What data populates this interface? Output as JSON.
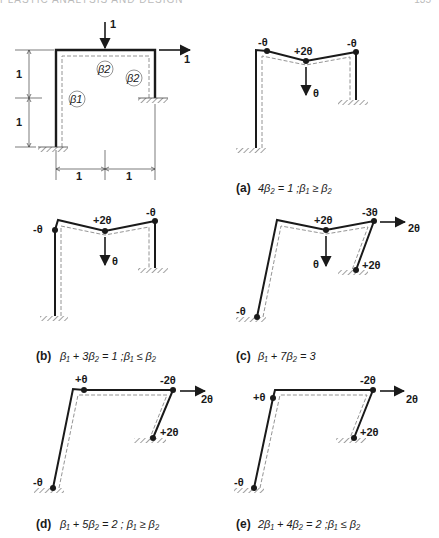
{
  "header": {
    "left_text": "PLASTIC ANALYSIS AND DESIGN",
    "right_text": "135"
  },
  "base_frame": {
    "load_vertical": "1",
    "load_horizontal": "1",
    "dim_v_upper": "1",
    "dim_v_lower": "1",
    "dim_h_left": "1",
    "dim_h_right": "1",
    "moment_labels": [
      "β1",
      "β2",
      "β2"
    ]
  },
  "panels": [
    {
      "id": "a",
      "caption_letter": "(a)",
      "caption_eq": "4β₂ = 1 ;β₁ ≥ β₂",
      "hinges": [
        "-θ",
        "+2θ",
        "-θ"
      ],
      "displacement": "θ"
    },
    {
      "id": "b",
      "caption_letter": "(b)",
      "caption_eq": "β₁ + 3β₂ = 1 ;β₁ ≤ β₂",
      "hinges": [
        "-θ",
        "+2θ",
        "-θ"
      ],
      "displacement": "θ"
    },
    {
      "id": "c",
      "caption_letter": "(c)",
      "caption_eq": "β₁ + 7β₂ = 3",
      "hinges": [
        "-θ",
        "+2θ",
        "-3θ",
        "+2θ"
      ],
      "displacement": "θ",
      "sway": "2θ"
    },
    {
      "id": "d",
      "caption_letter": "(d)",
      "caption_eq": "β₁ + 5β₂ = 2 ; β₁ ≥ β₂",
      "hinges": [
        "-θ",
        "+θ",
        "-2θ",
        "+2θ"
      ],
      "sway": "2θ"
    },
    {
      "id": "e",
      "caption_letter": "(e)",
      "caption_eq": "2β₁ + 4β₂ = 2 ;β₁ ≤ β₂",
      "hinges": [
        "-θ",
        "+θ",
        "-2θ",
        "+2θ"
      ],
      "sway": "2θ"
    }
  ]
}
